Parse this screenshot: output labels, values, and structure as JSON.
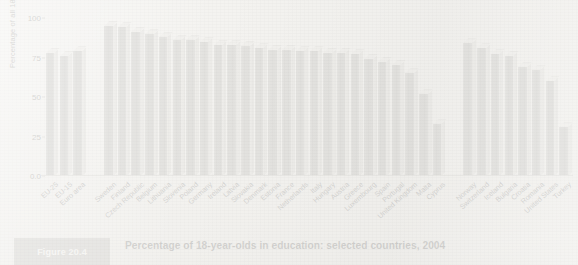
{
  "figure": {
    "tag": "Figure 20.4",
    "caption": "Percentage of 18-year-olds in education: selected countries, 2004"
  },
  "chart_data": {
    "type": "bar",
    "title": "Percentage of 18-year-olds in education: selected countries, 2004",
    "xlabel": "",
    "ylabel": "Percentage of all 18-year-olds",
    "ylim": [
      0,
      100
    ],
    "yticks": [
      "0.0",
      "25",
      "50",
      "75",
      "100"
    ],
    "ytick_values": [
      0,
      25,
      50,
      75,
      100
    ],
    "grid": false,
    "legend": false,
    "categories": [
      "EU-25",
      "EU-15",
      "Euro area",
      "Sweden",
      "Finland",
      "Czech Republic",
      "Belgium",
      "Lithuania",
      "Slovenia",
      "Poland",
      "Germany",
      "Ireland",
      "Latvia",
      "Slovakia",
      "Denmark",
      "Estonia",
      "France",
      "Netherlands",
      "Italy",
      "Hungary",
      "Austria",
      "Greece",
      "Luxembourg",
      "Spain",
      "Portugal",
      "United Kingdom",
      "Malta",
      "Cyprus",
      "Norway",
      "Switzerland",
      "Iceland",
      "Bulgaria",
      "Croatia",
      "Romania",
      "United States",
      "Turkey"
    ],
    "values": [
      78,
      76,
      79,
      95,
      94,
      91,
      90,
      88,
      86,
      86,
      85,
      83,
      83,
      82,
      81,
      80,
      80,
      79,
      79,
      78,
      78,
      77,
      74,
      72,
      70,
      65,
      52,
      33,
      84,
      81,
      77,
      76,
      69,
      67,
      60,
      31
    ],
    "groups": [
      {
        "name": "EU aggregates",
        "start": 0,
        "end": 2
      },
      {
        "name": "EU member states",
        "start": 3,
        "end": 27
      },
      {
        "name": "Non-EU countries",
        "start": 28,
        "end": 35
      }
    ],
    "bar_color": "#8e8e8b",
    "bar_top_color": "#e8e7e3",
    "bar_side_color": "#cdccc8",
    "background_color": "#f3f2ef"
  }
}
